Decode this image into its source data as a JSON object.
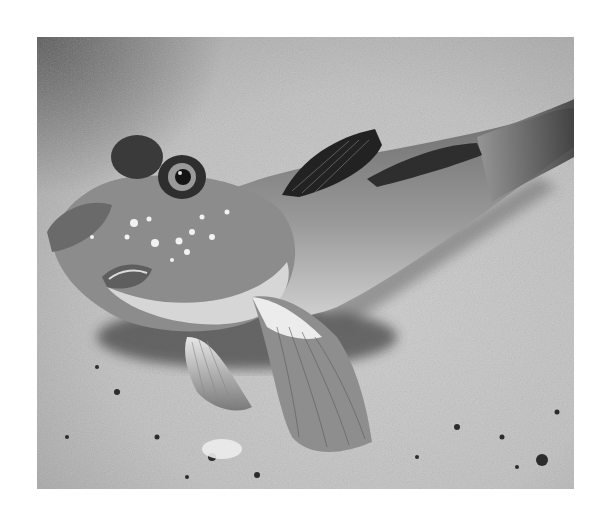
{
  "image": {
    "subject": "Mudskipper fish resting on sand",
    "alt_text": "Grayscale photograph of a mudskipper fish perched on sandy ground, head raised with bulging eyes, dark dorsal fins and spread pectoral fins",
    "tone": "grayscale",
    "colors": {
      "background_page": "#ffffff",
      "sand_light": "#cfcfcf",
      "sand_mid": "#b4b4b4",
      "sand_dark_corner": "#3a3a3a",
      "fish_body": "#8a8a8a",
      "fish_belly": "#d8d8d8",
      "fin_dark": "#2a2a2a",
      "shadow": "#4a4a4a"
    }
  }
}
